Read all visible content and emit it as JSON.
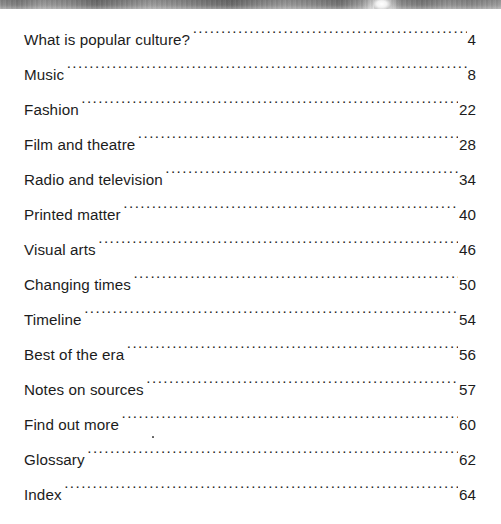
{
  "page": {
    "type": "book-table-of-contents",
    "background_color": "#ffffff",
    "text_color": "#1c1c1c",
    "leader_character": "."
  },
  "header_image": {
    "name": "grayscale-photo-strip",
    "description": "cropped grayscale photographic band along the top edge",
    "height_px": 9,
    "tone_range": [
      "#6c6c6c",
      "#f4f4f4"
    ],
    "highlight_x": 374
  },
  "contents": {
    "entries": [
      {
        "title": "What is popular culture?",
        "page": "4"
      },
      {
        "title": "Music",
        "page": "8"
      },
      {
        "title": "Fashion",
        "page": "22"
      },
      {
        "title": "Film and theatre",
        "page": "28"
      },
      {
        "title": "Radio and television",
        "page": "34"
      },
      {
        "title": "Printed matter",
        "page": "40"
      },
      {
        "title": "Visual arts",
        "page": "46"
      },
      {
        "title": "Changing times",
        "page": "50"
      },
      {
        "title": "Timeline",
        "page": "54"
      },
      {
        "title": "Best of the era",
        "page": "56"
      },
      {
        "title": "Notes on sources",
        "page": "57"
      },
      {
        "title": "Find out more",
        "page": "60"
      },
      {
        "title": "Glossary",
        "page": "62"
      },
      {
        "title": "Index",
        "page": "64"
      }
    ]
  },
  "artifacts": {
    "speck": {
      "x": 152,
      "y": 436
    }
  }
}
